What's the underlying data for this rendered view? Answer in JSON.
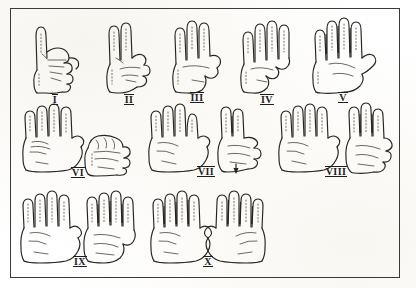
{
  "figure": {
    "background_color": "#ffffff",
    "ink_color": "#26241f",
    "frame_color": "#3a3a38",
    "border": "thin rectangular single-rule frame"
  },
  "rows": [
    {
      "row_index": 1,
      "items": [
        {
          "numeral": "I",
          "value": 1,
          "hands": 1,
          "left_fingers": 1,
          "right_fingers": 0,
          "description": "single right hand, index finger extended upward, remaining fingers curled into fist, thumb tucked"
        },
        {
          "numeral": "II",
          "value": 2,
          "hands": 1,
          "left_fingers": 2,
          "right_fingers": 0,
          "description": "single hand, index and middle fingers extended upward, ring and little fingers curled, thumb folded over"
        },
        {
          "numeral": "III",
          "value": 3,
          "hands": 1,
          "left_fingers": 3,
          "right_fingers": 0,
          "description": "single hand, index, middle and ring fingers extended, little finger curled, thumb across palm"
        },
        {
          "numeral": "IV",
          "value": 4,
          "hands": 1,
          "left_fingers": 4,
          "right_fingers": 0,
          "description": "single hand, all four fingers extended upward, thumb folded into palm"
        },
        {
          "numeral": "V",
          "value": 5,
          "hands": 1,
          "left_fingers": 5,
          "right_fingers": 0,
          "description": "single open hand, four fingers extended with dark shading between, thumb extended out to the side"
        }
      ]
    },
    {
      "row_index": 2,
      "items": [
        {
          "numeral": "VI",
          "value": 6,
          "hands": 2,
          "left_fingers": 5,
          "right_fingers": 1,
          "description": "two hands side by side, left hand fully open showing five, right hand closed fist with one finger"
        },
        {
          "numeral": "VII",
          "value": 7,
          "hands": 2,
          "left_fingers": 5,
          "right_fingers": 2,
          "description": "two hands, left hand fully open showing five, right hand showing two extended fingers"
        },
        {
          "numeral": "VIII",
          "value": 8,
          "hands": 2,
          "left_fingers": 5,
          "right_fingers": 3,
          "description": "two hands, left hand fully open showing five, right hand showing three extended fingers"
        }
      ]
    },
    {
      "row_index": 3,
      "items": [
        {
          "numeral": "IX",
          "value": 9,
          "hands": 2,
          "left_fingers": 5,
          "right_fingers": 4,
          "description": "two hands, left hand fully open showing five, right hand showing four extended fingers with little finger curled"
        },
        {
          "numeral": "X",
          "value": 10,
          "hands": 2,
          "left_fingers": 5,
          "right_fingers": 5,
          "description": "two hands both fully open, all ten fingers extended"
        }
      ]
    }
  ]
}
